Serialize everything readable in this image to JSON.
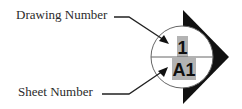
{
  "diagram": {
    "labels": {
      "drawing_number": "Drawing Number",
      "sheet_number": "Sheet Number"
    },
    "symbol": {
      "type": "section-callout",
      "drawing_number_value": "1",
      "sheet_number_value": "A1",
      "highlight_color": "#b3b3b3",
      "outline_color": "#555555",
      "arrow_color": "#111111"
    }
  }
}
